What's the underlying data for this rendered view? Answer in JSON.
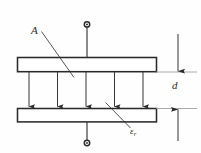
{
  "figure": {
    "type": "technical-line-diagram",
    "background_color": "#fefefe",
    "line_color": "#2b2b2b",
    "plate_fill": "#ffffff",
    "canvas": {
      "width": 201,
      "height": 153
    }
  },
  "labels": {
    "plate_area": {
      "text": "A",
      "meaning": "plate-area",
      "x": 31,
      "y": 25
    },
    "separation": {
      "text": "d",
      "meaning": "plate-separation-distance",
      "x": 172,
      "y": 80
    },
    "permittivity": {
      "symbol": "ε",
      "subscript": "r",
      "meaning": "relative-permittivity-of-dielectric",
      "x": 130,
      "y": 127
    }
  },
  "geometry": {
    "top_plate": {
      "x": 17,
      "y": 57,
      "width": 140,
      "height": 15
    },
    "bottom_plate": {
      "x": 17,
      "y": 108,
      "width": 140,
      "height": 14
    },
    "top_terminal": {
      "x": 87,
      "y": 25,
      "radius": 2.6
    },
    "bottom_terminal": {
      "x": 87,
      "y": 143,
      "radius": 2.6
    },
    "field_arrows_x": [
      29,
      57,
      86,
      114,
      143
    ],
    "field_arrow_top_y": 72,
    "field_arrow_bottom_y": 107,
    "dimension_line_x": 178,
    "extension_line_top_y": 72,
    "extension_line_bottom_y": 108,
    "extension_line_right_x": 196,
    "leader_area": {
      "x1": 41,
      "y1": 31,
      "x2": 74,
      "y2": 77
    },
    "leader_epsilon": {
      "x1": 106,
      "y1": 103,
      "x2": 131,
      "y2": 127
    }
  },
  "annotations": {
    "arrow_count": 5,
    "arrow_direction": "down",
    "dimension_arrow_direction": "outward"
  }
}
